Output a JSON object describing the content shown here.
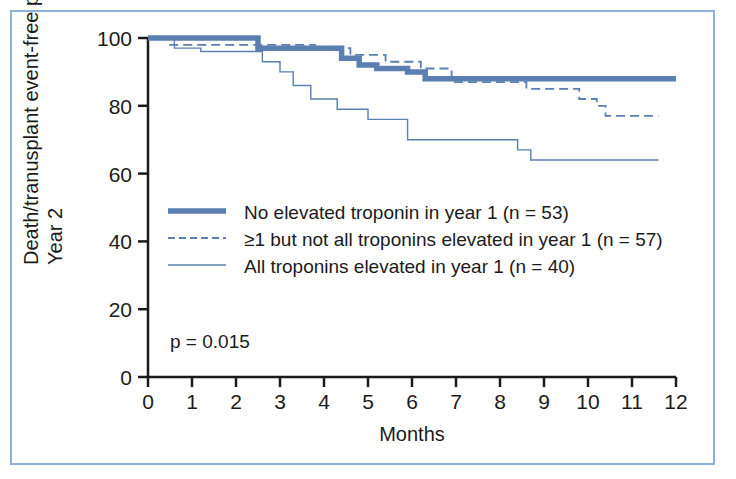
{
  "figure": {
    "border_color": "#8fb0d8",
    "background": "#ffffff"
  },
  "chart_data": {
    "type": "line",
    "title": "",
    "xlabel": "Months",
    "ylabel": "Death/tranusplant event-free probability (%)",
    "ylabel_line2": "Year 2",
    "xlim": [
      0,
      12
    ],
    "ylim": [
      0,
      100
    ],
    "xticks": [
      0,
      1,
      2,
      3,
      4,
      5,
      6,
      7,
      8,
      9,
      10,
      11,
      12
    ],
    "yticks": [
      0,
      20,
      40,
      60,
      80,
      100
    ],
    "grid": false,
    "legend_position": "center-left",
    "annotation": "p = 0.015",
    "accent_color": "#5b7fb0",
    "series": [
      {
        "name": "No elevated troponin in year 1 (n = 53)",
        "n": 53,
        "style": "thick-solid",
        "color": "#5b7fb0",
        "final_value": 88,
        "x": [
          0,
          2.5,
          2.5,
          4.4,
          4.4,
          4.8,
          4.8,
          5.2,
          5.2,
          5.9,
          5.9,
          6.3,
          6.3,
          12
        ],
        "y": [
          100,
          100,
          97,
          97,
          94,
          94,
          92,
          92,
          91,
          91,
          90,
          90,
          88,
          88
        ]
      },
      {
        "name": "≥1 but not all troponins elevated in year 1 (n = 57)",
        "n": 57,
        "style": "dashed",
        "color": "#5b7fb0",
        "final_value": 77,
        "x": [
          0,
          0.5,
          0.5,
          3.8,
          3.8,
          4.6,
          4.6,
          5.4,
          5.4,
          6.2,
          6.2,
          6.9,
          6.9,
          8.6,
          8.6,
          9.8,
          9.8,
          10.2,
          10.2,
          10.4,
          10.4,
          11.6
        ],
        "y": [
          100,
          100,
          98,
          98,
          97,
          97,
          95,
          95,
          93,
          93,
          91,
          91,
          87,
          87,
          85,
          85,
          82,
          82,
          80,
          80,
          77,
          77
        ]
      },
      {
        "name": "All troponins elevated in year 1 (n = 40)",
        "n": 40,
        "style": "thin-solid",
        "color": "#5b7fb0",
        "final_value": 64,
        "x": [
          0,
          0.6,
          0.6,
          1.2,
          1.2,
          2.6,
          2.6,
          3.0,
          3.0,
          3.3,
          3.3,
          3.7,
          3.7,
          4.3,
          4.3,
          5.0,
          5.0,
          5.9,
          5.9,
          8.4,
          8.4,
          8.7,
          8.7,
          11.6
        ],
        "y": [
          100,
          100,
          97,
          97,
          96,
          96,
          93,
          93,
          90,
          90,
          86,
          86,
          82,
          82,
          79,
          79,
          76,
          76,
          70,
          70,
          67,
          67,
          64,
          64
        ]
      }
    ]
  },
  "legend": {
    "items": [
      {
        "label": "No elevated troponin in year 1 (n = 53)",
        "style": "thick-solid"
      },
      {
        "label": "≥1 but not all troponins elevated in year 1 (n = 57)",
        "style": "dashed"
      },
      {
        "label": "All troponins elevated in year 1 (n = 40)",
        "style": "thin-solid"
      }
    ]
  }
}
